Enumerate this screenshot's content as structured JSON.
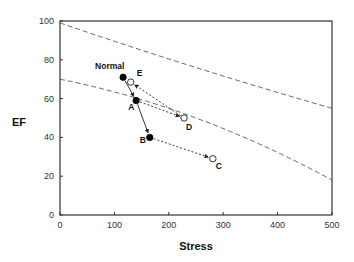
{
  "chart_data": {
    "type": "scatter",
    "title": "",
    "xlabel": "Stress",
    "ylabel": "EF",
    "xlim": [
      0,
      500
    ],
    "ylim": [
      0,
      100
    ],
    "x_ticks": [
      "0",
      "100",
      "200",
      "300",
      "400",
      "500"
    ],
    "y_ticks": [
      "0",
      "20",
      "40",
      "60",
      "80",
      "100"
    ],
    "grid": false,
    "points": [
      {
        "label": "Normal",
        "x": 116,
        "y": 71,
        "filled": true
      },
      {
        "label": "E",
        "x": 130,
        "y": 68.5,
        "filled": false
      },
      {
        "label": "A",
        "x": 140,
        "y": 59,
        "filled": true
      },
      {
        "label": "D",
        "x": 228,
        "y": 50,
        "filled": false
      },
      {
        "label": "B",
        "x": 165,
        "y": 40,
        "filled": true
      },
      {
        "label": "C",
        "x": 281,
        "y": 29,
        "filled": false
      }
    ],
    "arrows": [
      {
        "from": "Normal",
        "to": "A",
        "style": "solid"
      },
      {
        "from": "A",
        "to": "B",
        "style": "solid"
      },
      {
        "from": "A",
        "to": "D",
        "style": "dotted"
      },
      {
        "from": "D",
        "to": "E",
        "style": "dotted"
      },
      {
        "from": "B",
        "to": "C",
        "style": "dotted"
      }
    ],
    "reference_curves": [
      {
        "name": "upper-boundary",
        "style": "dashed",
        "points": [
          [
            0,
            99
          ],
          [
            250,
            76
          ],
          [
            500,
            55
          ]
        ]
      },
      {
        "name": "lower-boundary",
        "style": "dashed",
        "points": [
          [
            0,
            70
          ],
          [
            250,
            50
          ],
          [
            500,
            18
          ]
        ]
      }
    ]
  }
}
